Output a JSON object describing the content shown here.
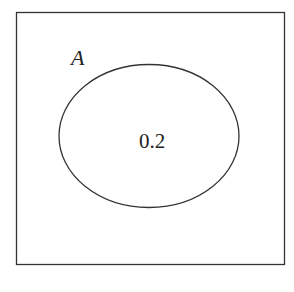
{
  "diagram": {
    "type": "venn",
    "universe": {
      "label": ""
    },
    "sets": [
      {
        "name": "A",
        "value": "0.2"
      }
    ],
    "stroke_color": "#333333"
  }
}
